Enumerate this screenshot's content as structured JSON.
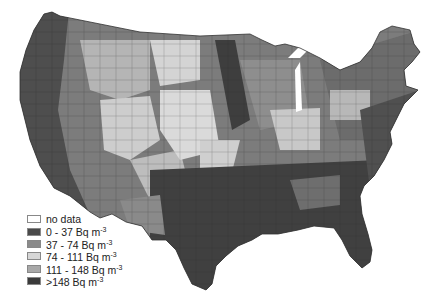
{
  "map": {
    "subject": "Radon concentration by US county",
    "region": "Contiguous United States"
  },
  "legend": {
    "items": [
      {
        "label": "no data",
        "unit": "",
        "sup": "",
        "color": "#ffffff"
      },
      {
        "label": "0 - 37 Bq m",
        "sup": "-3",
        "color": "#4a4a4a"
      },
      {
        "label": "37 - 74 Bq m",
        "sup": "-3",
        "color": "#8a8a8a"
      },
      {
        "label": "74 - 111 Bq m",
        "sup": "-3",
        "color": "#d6d6d6"
      },
      {
        "label": "111 - 148 Bq m",
        "sup": "-3",
        "color": "#a8a8a8"
      },
      {
        "label": ">148 Bq m",
        "sup": "-3",
        "color": "#3a3a3a"
      }
    ]
  },
  "colors": {
    "background": "#ffffff",
    "very_dark": "#3e3e3e",
    "dark": "#555555",
    "mid": "#808080",
    "light": "#cfcfcf",
    "lighter": "#e2e2e2",
    "border": "#2a2a2a"
  }
}
